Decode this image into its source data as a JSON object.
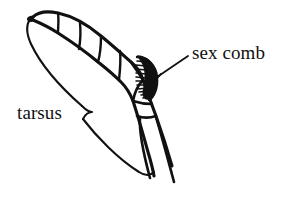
{
  "figure": {
    "kind": "anatomical-line-drawing",
    "background_color": "#ffffff",
    "ink_color": "#111111",
    "width": 294,
    "height": 209
  },
  "labels": {
    "sex_comb": "sex comb",
    "tarsus": "tarsus"
  },
  "annotations": {
    "sex_comb_leader": "leader-line from sex comb label to comb bristles",
    "tarsus_brace": "curly brace spanning the tarsal segments"
  },
  "structures": {
    "tarsal_segments_count": 5,
    "comb_bristle_count": 11,
    "claw_count": 2,
    "segment_names": [
      "tarsal-segment-5-distal",
      "tarsal-segment-4",
      "tarsal-segment-3",
      "tarsal-segment-2",
      "tarsal-segment-1-basitarsus",
      "tibia"
    ]
  }
}
